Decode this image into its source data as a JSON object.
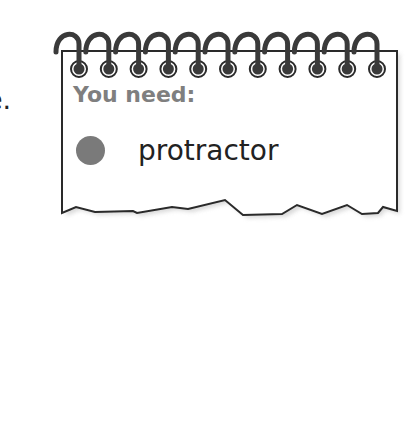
{
  "left_text_fragment": "e.",
  "notepad": {
    "title": "You need:",
    "items": [
      {
        "bullet_color": "#7a7a7a",
        "label": "protractor"
      }
    ],
    "ring_count": 11
  }
}
